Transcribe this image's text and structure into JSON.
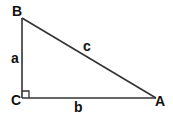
{
  "diagram": {
    "type": "right-triangle",
    "vertices": [
      {
        "id": "B",
        "label": "B",
        "x": 22,
        "y": 18
      },
      {
        "id": "C",
        "label": "C",
        "x": 22,
        "y": 98
      },
      {
        "id": "A",
        "label": "A",
        "x": 156,
        "y": 98
      }
    ],
    "sides": [
      {
        "id": "a",
        "label": "a",
        "from": "B",
        "to": "C"
      },
      {
        "id": "b",
        "label": "b",
        "from": "C",
        "to": "A"
      },
      {
        "id": "c",
        "label": "c",
        "from": "B",
        "to": "A"
      }
    ],
    "right_angle_at": "C",
    "stroke_color": "#333333",
    "label_color": "#111111"
  }
}
